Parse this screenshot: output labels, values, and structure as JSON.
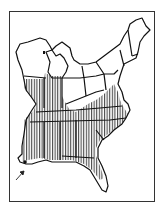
{
  "map": {
    "type": "range-map",
    "region": "Eastern United States",
    "colors": {
      "background": "#ffffff",
      "outline": "#111111",
      "hatch": "#222222",
      "frame": "#333333"
    },
    "legend": {
      "hatched": "distribution range"
    },
    "marker": {
      "type": "arrow",
      "location": "Gulf Coast (Mississippi/Alabama)"
    }
  }
}
